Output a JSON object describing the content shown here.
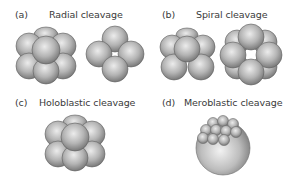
{
  "panels": [
    {
      "letter": "(a)",
      "title": "Radial cleavage"
    },
    {
      "letter": "(b)",
      "title": "Spiral cleavage"
    },
    {
      "letter": "(c)",
      "title": "Holoblastic cleavage"
    },
    {
      "letter": "(d)",
      "title": "Meroblastic cleavage"
    }
  ],
  "colors": {
    "cell_light": "#e8e8e8",
    "cell_mid": "#a8a8a8",
    "cell_dark": "#6e6e6e",
    "outline": "#5a5a5a"
  }
}
